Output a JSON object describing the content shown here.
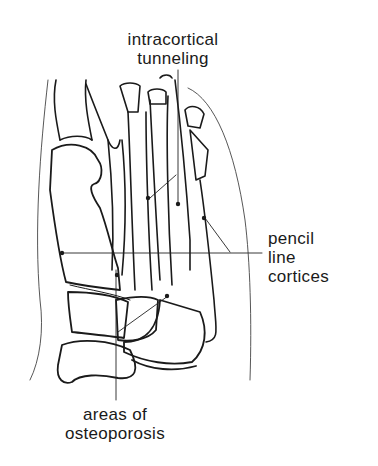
{
  "figure": {
    "labels": {
      "top": [
        "intracortical",
        "tunneling"
      ],
      "right": [
        "pencil",
        "line",
        "cortices"
      ],
      "bottom": [
        "areas of",
        "osteoporosis"
      ]
    }
  }
}
